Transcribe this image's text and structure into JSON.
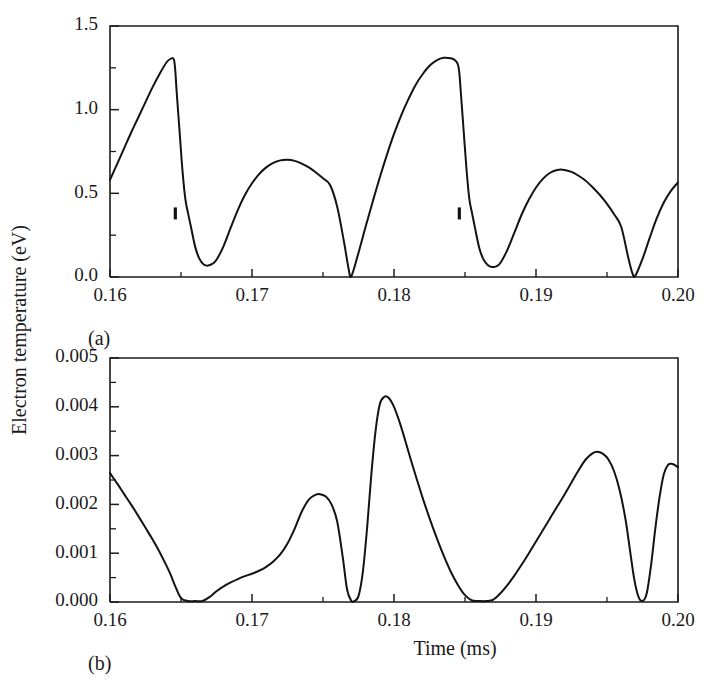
{
  "figure": {
    "ylabel": "Electron temperature (eV)",
    "xlabel": "Time (ms)",
    "line_color": "#131313",
    "axis_color": "#1c1c1c",
    "background": "#ffffff"
  },
  "chart_data": [
    {
      "type": "line",
      "panel_label": "(a)",
      "title": "",
      "xlabel": "",
      "ylabel": "Electron temperature (eV)",
      "xlim": [
        0.16,
        0.2
      ],
      "ylim": [
        0.0,
        1.5
      ],
      "grid": false,
      "legend": null,
      "xticks": [
        0.16,
        0.17,
        0.18,
        0.19,
        0.2
      ],
      "xticklabels": [
        "0.16",
        "0.17",
        "0.18",
        "0.19",
        "0.20"
      ],
      "xminorticks": [
        0.165,
        0.175,
        0.185,
        0.195
      ],
      "yticks": [
        0.0,
        0.5,
        1.0,
        1.5
      ],
      "yticklabels": [
        "0.0",
        "0.5",
        "1.0",
        "1.5"
      ],
      "yminorticks": [
        0.25,
        0.75,
        1.25
      ],
      "annotations": [
        {
          "name": "dropout-notch-1",
          "x": 0.1646,
          "y": 0.38
        },
        {
          "name": "dropout-notch-2",
          "x": 0.1846,
          "y": 0.38
        }
      ],
      "series": [
        {
          "name": "electron-temperature-a",
          "x": [
            0.16,
            0.1605,
            0.161,
            0.1615,
            0.162,
            0.1625,
            0.163,
            0.1635,
            0.164,
            0.1643,
            0.1645,
            0.1646,
            0.1647,
            0.1649,
            0.1651,
            0.1653,
            0.1655,
            0.1657,
            0.166,
            0.1663,
            0.1666,
            0.1669,
            0.1672,
            0.1675,
            0.168,
            0.1685,
            0.169,
            0.1695,
            0.17,
            0.1705,
            0.171,
            0.1715,
            0.172,
            0.1725,
            0.173,
            0.1735,
            0.174,
            0.1745,
            0.175,
            0.1755,
            0.176,
            0.1765,
            0.1768,
            0.177,
            0.1775,
            0.178,
            0.1785,
            0.179,
            0.1795,
            0.18,
            0.1805,
            0.181,
            0.1815,
            0.182,
            0.1825,
            0.183,
            0.1835,
            0.184,
            0.1843,
            0.1845,
            0.1846,
            0.1847,
            0.1849,
            0.1851,
            0.1853,
            0.1855,
            0.1857,
            0.186,
            0.1863,
            0.1866,
            0.1869,
            0.1872,
            0.1875,
            0.188,
            0.1885,
            0.189,
            0.1895,
            0.19,
            0.1905,
            0.191,
            0.1915,
            0.192,
            0.1925,
            0.193,
            0.1935,
            0.194,
            0.1945,
            0.195,
            0.1955,
            0.196,
            0.1965,
            0.1968,
            0.197,
            0.1975,
            0.198,
            0.1985,
            0.199,
            0.1995,
            0.2
          ],
          "y": [
            0.58,
            0.675,
            0.77,
            0.865,
            0.955,
            1.045,
            1.135,
            1.215,
            1.285,
            1.305,
            1.3,
            1.23,
            1.1,
            0.87,
            0.64,
            0.47,
            0.38,
            0.3,
            0.18,
            0.108,
            0.075,
            0.068,
            0.078,
            0.103,
            0.185,
            0.295,
            0.4,
            0.49,
            0.56,
            0.615,
            0.655,
            0.682,
            0.697,
            0.7,
            0.694,
            0.678,
            0.655,
            0.625,
            0.59,
            0.55,
            0.42,
            0.2,
            0.05,
            0.005,
            0.145,
            0.3,
            0.45,
            0.595,
            0.73,
            0.855,
            0.965,
            1.06,
            1.145,
            1.21,
            1.262,
            1.295,
            1.31,
            1.307,
            1.295,
            1.27,
            1.22,
            1.11,
            0.88,
            0.65,
            0.47,
            0.38,
            0.295,
            0.175,
            0.105,
            0.072,
            0.06,
            0.063,
            0.085,
            0.165,
            0.27,
            0.375,
            0.463,
            0.535,
            0.588,
            0.623,
            0.64,
            0.64,
            0.628,
            0.605,
            0.575,
            0.535,
            0.49,
            0.437,
            0.375,
            0.3,
            0.115,
            0.02,
            0.008,
            0.108,
            0.232,
            0.35,
            0.445,
            0.515,
            0.565
          ]
        }
      ]
    },
    {
      "type": "line",
      "panel_label": "(b)",
      "title": "",
      "xlabel": "Time (ms)",
      "ylabel": "Electron temperature (eV)",
      "xlim": [
        0.16,
        0.2
      ],
      "ylim": [
        0.0,
        0.005
      ],
      "grid": false,
      "legend": null,
      "xticks": [
        0.16,
        0.17,
        0.18,
        0.19,
        0.2
      ],
      "xticklabels": [
        "0.16",
        "0.17",
        "0.18",
        "0.19",
        "0.20"
      ],
      "xminorticks": [
        0.165,
        0.175,
        0.185,
        0.195
      ],
      "yticks": [
        0.0,
        0.001,
        0.002,
        0.003,
        0.004,
        0.005
      ],
      "yticklabels": [
        "0.000",
        "0.001",
        "0.002",
        "0.003",
        "0.004",
        "0.005"
      ],
      "yminorticks": [
        0.0005,
        0.0015,
        0.0025,
        0.0035,
        0.0045
      ],
      "annotations": [],
      "series": [
        {
          "name": "electron-temperature-b",
          "x": [
            0.16,
            0.1605,
            0.161,
            0.1615,
            0.162,
            0.1625,
            0.163,
            0.1635,
            0.164,
            0.1643,
            0.1646,
            0.165,
            0.1655,
            0.166,
            0.1665,
            0.167,
            0.1675,
            0.168,
            0.1685,
            0.169,
            0.1695,
            0.17,
            0.1705,
            0.171,
            0.1715,
            0.172,
            0.1725,
            0.173,
            0.1735,
            0.174,
            0.1745,
            0.1748,
            0.1752,
            0.1756,
            0.176,
            0.1764,
            0.1767,
            0.177,
            0.1772,
            0.1775,
            0.1778,
            0.1781,
            0.1784,
            0.1787,
            0.179,
            0.1793,
            0.1796,
            0.18,
            0.1804,
            0.1808,
            0.1812,
            0.1816,
            0.182,
            0.1825,
            0.183,
            0.1835,
            0.184,
            0.1845,
            0.185,
            0.1855,
            0.186,
            0.1865,
            0.187,
            0.1875,
            0.188,
            0.1885,
            0.189,
            0.1895,
            0.19,
            0.1905,
            0.191,
            0.1915,
            0.192,
            0.1925,
            0.193,
            0.1935,
            0.194,
            0.1943,
            0.1947,
            0.1951,
            0.1955,
            0.1959,
            0.1963,
            0.1966,
            0.1969,
            0.1972,
            0.1975,
            0.1978,
            0.1981,
            0.1984,
            0.1987,
            0.199,
            0.1993,
            0.1996,
            0.1998,
            0.2
          ],
          "y": [
            0.00264,
            0.00243,
            0.00221,
            0.00199,
            0.00176,
            0.00152,
            0.00128,
            0.00102,
            0.00073,
            0.00054,
            0.00032,
            8e-05,
            2e-05,
            2e-05,
            2e-05,
            0.0001,
            0.00022,
            0.00032,
            0.0004,
            0.00047,
            0.00053,
            0.00058,
            0.00064,
            0.00072,
            0.00083,
            0.00098,
            0.0012,
            0.0015,
            0.00185,
            0.0021,
            0.0022,
            0.00221,
            0.00216,
            0.002,
            0.00165,
            0.0009,
            0.00025,
            2e-05,
            2e-05,
            0.00012,
            0.0006,
            0.0015,
            0.0026,
            0.0035,
            0.00405,
            0.0042,
            0.00419,
            0.004,
            0.00368,
            0.0033,
            0.0029,
            0.00252,
            0.00215,
            0.00172,
            0.00132,
            0.00095,
            0.00062,
            0.00035,
            0.00014,
            3e-05,
            2e-05,
            2e-05,
            5e-05,
            0.00018,
            0.00035,
            0.00055,
            0.00077,
            0.001,
            0.00124,
            0.00148,
            0.00172,
            0.00196,
            0.0022,
            0.00245,
            0.0027,
            0.00292,
            0.00305,
            0.00308,
            0.00304,
            0.00292,
            0.00268,
            0.00228,
            0.0017,
            0.0011,
            0.0005,
            0.00012,
            2e-05,
            0.00018,
            0.00075,
            0.0015,
            0.00215,
            0.00262,
            0.00281,
            0.00283,
            0.0028,
            0.00276
          ]
        }
      ]
    }
  ]
}
